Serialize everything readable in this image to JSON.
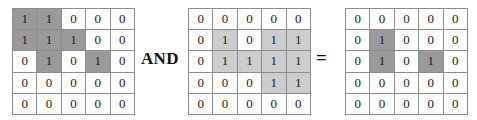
{
  "figure": {
    "caption": "",
    "operation": "bitwise-and-of-two-binary-matrices"
  },
  "operators": {
    "and_label": "AND",
    "equals_label": "="
  },
  "colors": {
    "background": "#ffffff",
    "cell_border": "#8c8c8c",
    "matrix_border": "#6e6e6e",
    "highlight_dark": "#9a9a9a",
    "highlight_light": "#cdcdcd",
    "text": "#1a1a1a"
  },
  "chart_data": {
    "type": "table",
    "title": "",
    "matrices": [
      {
        "name": "operand-a",
        "rows": 5,
        "cols": 5,
        "highlight_style": "dark",
        "values": [
          [
            1,
            1,
            0,
            0,
            0
          ],
          [
            1,
            1,
            1,
            0,
            0
          ],
          [
            0,
            1,
            0,
            1,
            0
          ],
          [
            0,
            0,
            0,
            0,
            0
          ],
          [
            0,
            0,
            0,
            0,
            0
          ]
        ]
      },
      {
        "name": "operand-b",
        "rows": 5,
        "cols": 5,
        "highlight_style": "light",
        "values": [
          [
            0,
            0,
            0,
            0,
            0
          ],
          [
            0,
            1,
            0,
            1,
            1
          ],
          [
            0,
            1,
            1,
            1,
            1
          ],
          [
            0,
            0,
            0,
            1,
            1
          ],
          [
            0,
            0,
            0,
            0,
            0
          ]
        ]
      },
      {
        "name": "result",
        "rows": 5,
        "cols": 5,
        "highlight_style": "dark",
        "values": [
          [
            0,
            0,
            0,
            0,
            0
          ],
          [
            0,
            1,
            0,
            0,
            0
          ],
          [
            0,
            1,
            0,
            1,
            0
          ],
          [
            0,
            0,
            0,
            0,
            0
          ],
          [
            0,
            0,
            0,
            0,
            0
          ]
        ]
      }
    ]
  }
}
